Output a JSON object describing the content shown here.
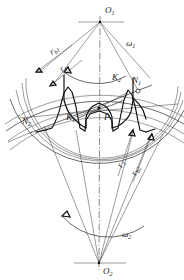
{
  "figure": {
    "background_color": "#ffffff",
    "line_color": "#111111",
    "thin_line_color": "#3a3a3a"
  },
  "labels": {
    "center_upper": {
      "base": "O",
      "sub": "1"
    },
    "center_lower": {
      "base": "O",
      "sub": "2"
    },
    "omega_upper": {
      "base": "ω",
      "sub": "1"
    },
    "omega_lower": {
      "base": "ω",
      "sub": "2"
    },
    "radius_base_upper": {
      "base": "r",
      "sub": "b1"
    },
    "radius_pitch_upper": {
      "base": "r",
      "sub": "1"
    },
    "radius_pitch_lower": {
      "base": "r",
      "sub": "2"
    },
    "radius_base_lower": {
      "base": "r",
      "sub": "b2"
    },
    "contact_n1": {
      "base": "N",
      "sub": "1"
    },
    "contact_n2": {
      "base": "N",
      "sub": "2"
    },
    "point_k1": {
      "base": "K",
      "sub": "1"
    },
    "point_k2": {
      "base": "K",
      "sub": "2"
    },
    "pitch_point": {
      "base": "P",
      "sub": ""
    }
  },
  "geometry": {
    "upper_center": {
      "x": 100,
      "y": 22
    },
    "lower_center": {
      "x": 99,
      "y": 263
    },
    "pitch_point": {
      "x": 99,
      "y": 108
    },
    "n1_point": {
      "x": 137,
      "y": 90
    },
    "n2_point": {
      "x": 44,
      "y": 128
    },
    "upper_pitch_radius": 86,
    "upper_base_radius": 80,
    "upper_addendum_radius": 94,
    "lower_pitch_radius": 155,
    "lower_base_radius": 146,
    "lower_addendum_radius": 165
  }
}
